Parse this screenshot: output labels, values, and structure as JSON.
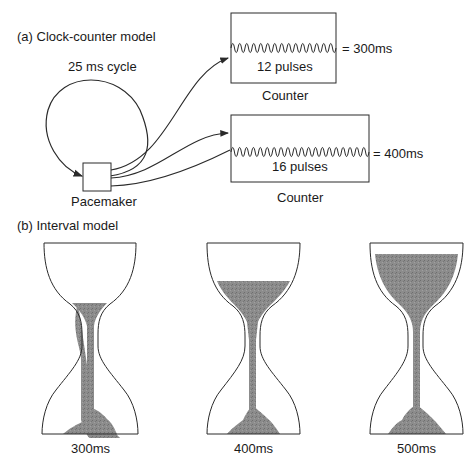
{
  "section_a": {
    "title": "(a) Clock-counter model",
    "cycle_label": "25 ms cycle",
    "pacemaker_label": "Pacemaker",
    "counters": [
      {
        "pulses_label": "12 pulses",
        "pulse_count": 12,
        "result": "= 300ms",
        "caption": "Counter"
      },
      {
        "pulses_label": "16 pulses",
        "pulse_count": 16,
        "result": "= 400ms",
        "caption": "Counter"
      }
    ]
  },
  "section_b": {
    "title": "(b) Interval model",
    "hourglasses": [
      {
        "label": "300ms",
        "fill_level": "low"
      },
      {
        "label": "400ms",
        "fill_level": "medium"
      },
      {
        "label": "500ms",
        "fill_level": "high"
      }
    ]
  },
  "colors": {
    "line": "#2a2a2a",
    "sand": "#8a8a8a",
    "background": "#ffffff"
  }
}
